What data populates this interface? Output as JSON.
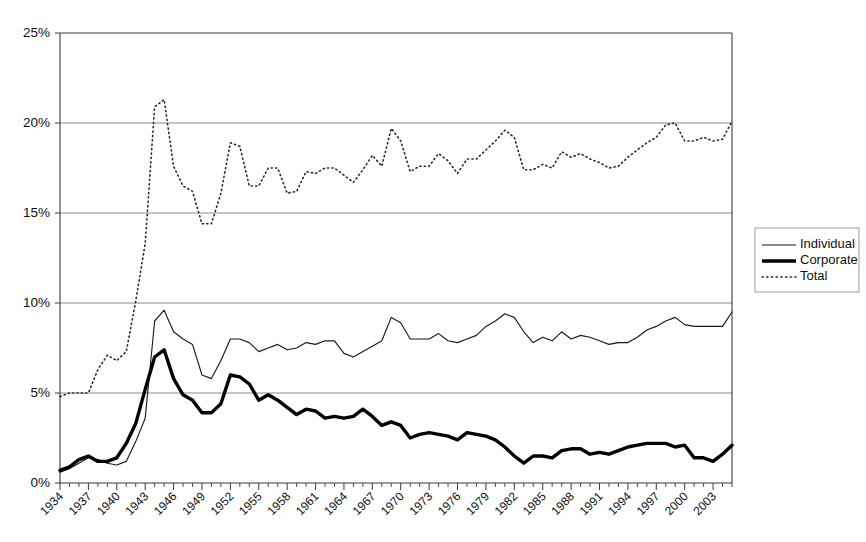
{
  "chart_data": {
    "type": "line",
    "title": "",
    "subtitle": "",
    "xlabel": "",
    "ylabel": "",
    "ylim": [
      0,
      25
    ],
    "yticks": [
      "0%",
      "5%",
      "10%",
      "15%",
      "20%",
      "25%"
    ],
    "ytick_values": [
      0,
      5,
      10,
      15,
      20,
      25
    ],
    "grid": "horizontal",
    "legend_position": "right",
    "xtick_labels": [
      "1934",
      "1937",
      "1940",
      "1943",
      "1946",
      "1949",
      "1952",
      "1955",
      "1958",
      "1961",
      "1964",
      "1967",
      "1970",
      "1973",
      "1976",
      "1979",
      "1982",
      "1985",
      "1988",
      "1991",
      "1994",
      "1997",
      "2000",
      "2003"
    ],
    "xtick_step": 3,
    "x": [
      1934,
      1935,
      1936,
      1937,
      1938,
      1939,
      1940,
      1941,
      1942,
      1943,
      1944,
      1945,
      1946,
      1947,
      1948,
      1949,
      1950,
      1951,
      1952,
      1953,
      1954,
      1955,
      1956,
      1957,
      1958,
      1959,
      1960,
      1961,
      1962,
      1963,
      1964,
      1965,
      1966,
      1967,
      1968,
      1969,
      1970,
      1971,
      1972,
      1973,
      1974,
      1975,
      1976,
      1977,
      1978,
      1979,
      1980,
      1981,
      1982,
      1983,
      1984,
      1985,
      1986,
      1987,
      1988,
      1989,
      1990,
      1991,
      1992,
      1993,
      1994,
      1995,
      1996,
      1997,
      1998,
      1999,
      2000,
      2001,
      2002,
      2003,
      2004,
      2005
    ],
    "series": [
      {
        "name": "Individual",
        "style": "thin-solid",
        "values": [
          0.6,
          0.8,
          1.1,
          1.4,
          1.3,
          1.1,
          1.0,
          1.2,
          2.3,
          3.6,
          9.0,
          9.6,
          8.4,
          8.0,
          7.7,
          6.0,
          5.8,
          6.8,
          8.0,
          8.0,
          7.8,
          7.3,
          7.5,
          7.7,
          7.4,
          7.5,
          7.8,
          7.7,
          7.9,
          7.9,
          7.2,
          7.0,
          7.3,
          7.6,
          7.9,
          9.2,
          8.9,
          8.0,
          8.0,
          8.0,
          8.3,
          7.9,
          7.8,
          8.0,
          8.2,
          8.7,
          9.0,
          9.4,
          9.2,
          8.4,
          7.8,
          8.1,
          7.9,
          8.4,
          8.0,
          8.2,
          8.1,
          7.9,
          7.7,
          7.8,
          7.8,
          8.1,
          8.5,
          8.7,
          9.0,
          9.2,
          8.8,
          8.7,
          8.7,
          8.7,
          8.7,
          9.5
        ]
      },
      {
        "name": "Corporate",
        "style": "thick-solid",
        "values": [
          0.7,
          0.9,
          1.3,
          1.5,
          1.2,
          1.2,
          1.4,
          2.2,
          3.3,
          5.2,
          7.0,
          7.4,
          5.8,
          4.9,
          4.6,
          3.9,
          3.9,
          4.4,
          6.0,
          5.9,
          5.5,
          4.6,
          4.9,
          4.6,
          4.2,
          3.8,
          4.1,
          4.0,
          3.6,
          3.7,
          3.6,
          3.7,
          4.1,
          3.7,
          3.2,
          3.4,
          3.2,
          2.5,
          2.7,
          2.8,
          2.7,
          2.6,
          2.4,
          2.8,
          2.7,
          2.6,
          2.4,
          2.0,
          1.5,
          1.1,
          1.5,
          1.5,
          1.4,
          1.8,
          1.9,
          1.9,
          1.6,
          1.7,
          1.6,
          1.8,
          2.0,
          2.1,
          2.2,
          2.2,
          2.2,
          2.0,
          2.1,
          1.4,
          1.4,
          1.2,
          1.6,
          2.1
        ]
      },
      {
        "name": "Total",
        "style": "dotted",
        "values": [
          4.8,
          5.0,
          5.0,
          5.0,
          6.3,
          7.1,
          6.8,
          7.3,
          10.1,
          13.3,
          20.9,
          21.3,
          17.6,
          16.5,
          16.2,
          14.4,
          14.4,
          16.1,
          18.9,
          18.7,
          16.5,
          16.5,
          17.5,
          17.5,
          16.1,
          16.2,
          17.3,
          17.2,
          17.5,
          17.5,
          17.1,
          16.7,
          17.4,
          18.2,
          17.6,
          19.7,
          19.0,
          17.3,
          17.6,
          17.6,
          18.3,
          17.9,
          17.2,
          18.0,
          18.0,
          18.5,
          19.0,
          19.6,
          19.2,
          17.4,
          17.4,
          17.7,
          17.5,
          18.4,
          18.1,
          18.3,
          18.0,
          17.8,
          17.5,
          17.6,
          18.1,
          18.5,
          18.9,
          19.2,
          19.9,
          20.0,
          19.0,
          19.0,
          19.2,
          19.0,
          19.1,
          20.1
        ]
      }
    ],
    "legend": [
      {
        "label": "Individual"
      },
      {
        "label": "Corporate"
      },
      {
        "label": "Total"
      }
    ]
  }
}
